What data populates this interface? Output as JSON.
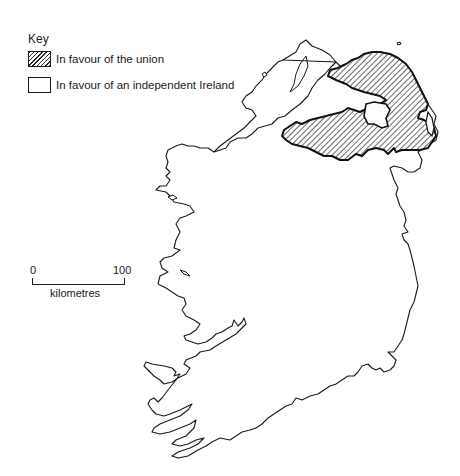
{
  "key": {
    "title": "Key",
    "items": [
      {
        "label": "In favour of the union",
        "pattern": "hatched"
      },
      {
        "label": "In favour of an independent Ireland",
        "pattern": "blank"
      }
    ]
  },
  "scale_bar": {
    "start_label": "0",
    "end_label": "100",
    "unit_label": "kilometres"
  },
  "map": {
    "subject": "Ireland",
    "regions": [
      {
        "name": "union-region",
        "fill": "hatched",
        "color": "#2a2a2a"
      },
      {
        "name": "independent-region",
        "fill": "blank",
        "color": "#ffffff"
      }
    ]
  }
}
